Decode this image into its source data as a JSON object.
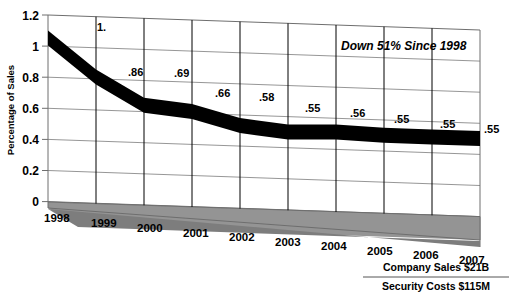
{
  "chart_data": {
    "type": "area",
    "title": "",
    "subtitle": "",
    "xlabel": "",
    "ylabel": "Percentage of Sales",
    "categories": [
      "1998",
      "1999",
      "2000",
      "2001",
      "2002",
      "2003",
      "2004",
      "2005",
      "2006",
      "2007"
    ],
    "values": [
      1.1,
      0.86,
      0.69,
      0.66,
      0.58,
      0.55,
      0.56,
      0.55,
      0.55,
      0.55
    ],
    "point_labels": [
      "1.",
      ".86",
      ".69",
      ".66",
      ".58",
      ".55",
      ".56",
      ".55",
      ".55",
      ".55"
    ],
    "ylim": [
      0,
      1.2
    ],
    "ytick_labels": [
      "0",
      "0.2",
      "0.4",
      "0.6",
      "0.8",
      "1",
      "1.2"
    ],
    "ytick_values": [
      0,
      0.2,
      0.4,
      0.6,
      0.8,
      1.0,
      1.2
    ],
    "grid": true,
    "legend": "none",
    "series": [
      {
        "name": "Percentage of Sales",
        "values": [
          1.1,
          0.86,
          0.69,
          0.66,
          0.58,
          0.55,
          0.56,
          0.55,
          0.55,
          0.55
        ],
        "color": "#000000"
      }
    ],
    "annotations": [
      {
        "text": "Down 51% Since 1998",
        "style": "bold-italic"
      },
      {
        "text": "Company Sales $21B",
        "style": "bold"
      },
      {
        "text": "Security Costs $115M",
        "style": "bold"
      }
    ],
    "style": {
      "three_d": true,
      "floor_color": "#949494",
      "floor_front_color": "#7d7d7d",
      "wall_color": "#ffffff",
      "ribbon_color": "#000000",
      "grid_color": "#8a8a8a"
    }
  },
  "axis": {
    "y_title": "Percentage of Sales",
    "y_ticks": [
      "1.2",
      "1",
      "0.8",
      "0.6",
      "0.4",
      "0.2",
      "0"
    ],
    "x_ticks": [
      "1998",
      "1999",
      "2000",
      "2001",
      "2002",
      "2003",
      "2004",
      "2005",
      "2006",
      "2007"
    ]
  },
  "data_labels": {
    "l0": "1.",
    "l1": ".86",
    "l2": ".69",
    "l3": ".66",
    "l4": ".58",
    "l5": ".55",
    "l6": ".56",
    "l7": ".55",
    "l8": ".55",
    "l9": ".55"
  },
  "callout": {
    "headline": "Down 51% Since 1998"
  },
  "ratio_note": {
    "numerator": "Company Sales $21B",
    "denominator": "Security Costs $115M"
  }
}
